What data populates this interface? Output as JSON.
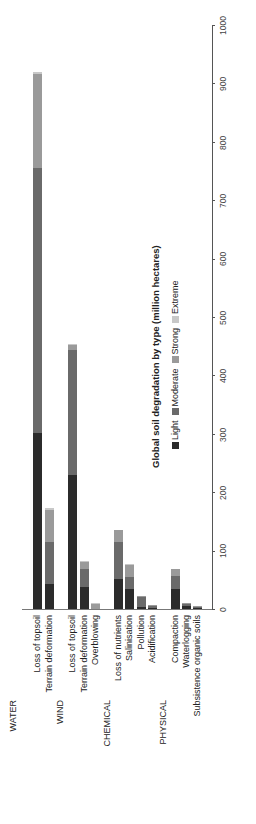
{
  "chart_data": {
    "type": "bar",
    "stacked": true,
    "orientation": "vertical (figure rotated 90°)",
    "title": "Global soil degradation by type (million hectares)",
    "xlabel": "",
    "ylabel": "",
    "ylim": [
      0,
      1000
    ],
    "yticks": [
      0,
      100,
      200,
      300,
      400,
      500,
      600,
      700,
      800,
      900,
      1000
    ],
    "grid": false,
    "legend_position": "right of title",
    "groups": [
      {
        "name": "WATER",
        "categories": [
          "Loss of topsoil",
          "Terrain deformation"
        ]
      },
      {
        "name": "WIND",
        "categories": [
          "Loss of topsoil",
          "Terrain deformation",
          "Overblowing"
        ]
      },
      {
        "name": "CHEMICAL",
        "categories": [
          "Loss of nutrients",
          "Salinisation",
          "Pollution",
          "Acidification"
        ]
      },
      {
        "name": "PHYSICAL",
        "categories": [
          "Compaction",
          "Waterlogging",
          "Subsistence organic soils"
        ]
      }
    ],
    "categories": [
      "Loss of topsoil",
      "Terrain deformation",
      "Loss of topsoil",
      "Terrain deformation",
      "Overblowing",
      "Loss of nutrients",
      "Salinisation",
      "Pollution",
      "Acidification",
      "Compaction",
      "Waterlogging",
      "Subsistence organic soils"
    ],
    "series": [
      {
        "name": "Light",
        "color": "#2b2b2b",
        "values": [
          301,
          42,
          230,
          38,
          0,
          52,
          35,
          4,
          2,
          35,
          5,
          3
        ]
      },
      {
        "name": "Moderate",
        "color": "#6a6a6a",
        "values": [
          454,
          72,
          213,
          30,
          0,
          63,
          20,
          17,
          3,
          22,
          4,
          1
        ]
      },
      {
        "name": "Strong",
        "color": "#9a9a9a",
        "values": [
          161,
          56,
          9,
          14,
          10,
          20,
          21,
          1,
          1,
          11,
          1,
          1
        ]
      },
      {
        "name": "Extreme",
        "color": "#c8c8c8",
        "values": [
          4,
          3,
          2,
          1,
          1,
          0,
          1,
          0,
          0,
          0,
          0,
          0
        ]
      }
    ]
  },
  "layout": {
    "bar_x": [
      37,
      49,
      72,
      84,
      95,
      118,
      129,
      141,
      152,
      175,
      186,
      197
    ],
    "group_x": [
      13,
      60,
      107,
      163
    ]
  }
}
